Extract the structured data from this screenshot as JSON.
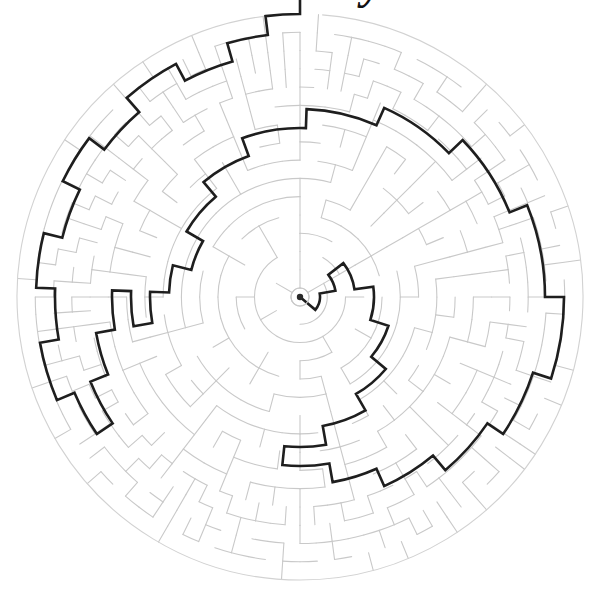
{
  "page": {
    "width": 606,
    "height": 604,
    "background_color": "#ffffff"
  },
  "title_fragment": {
    "text": "y",
    "note": "cropped descender of title text above the top edge",
    "color": "#111111"
  },
  "maze": {
    "type": "circular-theta-maze",
    "center_x": 300,
    "center_y": 297,
    "outer_radius": 283,
    "hub_radius": 9,
    "ring_count": 15,
    "wall_color": "#c9c9c9",
    "wall_width": 1.1,
    "outer_border_color": "#d2d2d2",
    "solution_color": "#1e1e1e",
    "solution_width": 2.6,
    "goal_dot_color": "#2a2a2a",
    "goal_dot_radius": 3.2,
    "entrance_angle_deg": -90,
    "entrance_label": "top",
    "goal_label": "center",
    "seed": 20240517,
    "cells_per_ring": [
      6,
      6,
      12,
      12,
      24,
      24,
      24,
      48,
      48,
      48,
      48,
      96,
      96,
      96,
      96
    ],
    "solution_waypoints": [
      {
        "r": 300,
        "a": -90
      },
      {
        "r": 283,
        "a": -90
      },
      {
        "r": 283,
        "a": -97
      },
      {
        "r": 264,
        "a": -97
      },
      {
        "r": 264,
        "a": -106
      },
      {
        "r": 245,
        "a": -106
      },
      {
        "r": 245,
        "a": -118
      },
      {
        "r": 264,
        "a": -118
      },
      {
        "r": 264,
        "a": -131
      },
      {
        "r": 245,
        "a": -131
      },
      {
        "r": 245,
        "a": -143
      },
      {
        "r": 264,
        "a": -143
      },
      {
        "r": 264,
        "a": -154
      },
      {
        "r": 245,
        "a": -154
      },
      {
        "r": 245,
        "a": -166
      },
      {
        "r": 264,
        "a": -166
      },
      {
        "r": 264,
        "a": -178
      },
      {
        "r": 245,
        "a": -178
      },
      {
        "r": 245,
        "a": -190
      },
      {
        "r": 264,
        "a": -190
      },
      {
        "r": 264,
        "a": -203
      },
      {
        "r": 245,
        "a": -203
      },
      {
        "r": 245,
        "a": -214
      },
      {
        "r": 226,
        "a": -214
      },
      {
        "r": 226,
        "a": -202
      },
      {
        "r": 207,
        "a": -202
      },
      {
        "r": 207,
        "a": -190
      },
      {
        "r": 188,
        "a": -190
      },
      {
        "r": 188,
        "a": -178
      },
      {
        "r": 169,
        "a": -178
      },
      {
        "r": 169,
        "a": -190
      },
      {
        "r": 150,
        "a": -190
      },
      {
        "r": 150,
        "a": -178
      },
      {
        "r": 131,
        "a": -178
      },
      {
        "r": 131,
        "a": -166
      },
      {
        "r": 112,
        "a": -166
      },
      {
        "r": 112,
        "a": -150
      },
      {
        "r": 131,
        "a": -150
      },
      {
        "r": 131,
        "a": -130
      },
      {
        "r": 150,
        "a": -130
      },
      {
        "r": 150,
        "a": -110
      },
      {
        "r": 169,
        "a": -110
      },
      {
        "r": 169,
        "a": -88
      },
      {
        "r": 188,
        "a": -88
      },
      {
        "r": 188,
        "a": -66
      },
      {
        "r": 207,
        "a": -66
      },
      {
        "r": 207,
        "a": -44
      },
      {
        "r": 226,
        "a": -44
      },
      {
        "r": 226,
        "a": -22
      },
      {
        "r": 245,
        "a": -22
      },
      {
        "r": 245,
        "a": 0
      },
      {
        "r": 264,
        "a": 0
      },
      {
        "r": 264,
        "a": 18
      },
      {
        "r": 245,
        "a": 18
      },
      {
        "r": 245,
        "a": 34
      },
      {
        "r": 226,
        "a": 34
      },
      {
        "r": 226,
        "a": 50
      },
      {
        "r": 207,
        "a": 50
      },
      {
        "r": 207,
        "a": 66
      },
      {
        "r": 188,
        "a": 66
      },
      {
        "r": 188,
        "a": 80
      },
      {
        "r": 169,
        "a": 80
      },
      {
        "r": 169,
        "a": 96
      },
      {
        "r": 150,
        "a": 96
      },
      {
        "r": 150,
        "a": 80
      },
      {
        "r": 131,
        "a": 80
      },
      {
        "r": 131,
        "a": 60
      },
      {
        "r": 112,
        "a": 60
      },
      {
        "r": 112,
        "a": 40
      },
      {
        "r": 93,
        "a": 40
      },
      {
        "r": 93,
        "a": 18
      },
      {
        "r": 74,
        "a": 18
      },
      {
        "r": 74,
        "a": -8
      },
      {
        "r": 55,
        "a": -8
      },
      {
        "r": 55,
        "a": -38
      },
      {
        "r": 36,
        "a": -38
      },
      {
        "r": 36,
        "a": -10
      },
      {
        "r": 20,
        "a": -10
      },
      {
        "r": 20,
        "a": 40
      },
      {
        "r": 9,
        "a": 40
      },
      {
        "r": 0,
        "a": 40
      }
    ]
  }
}
